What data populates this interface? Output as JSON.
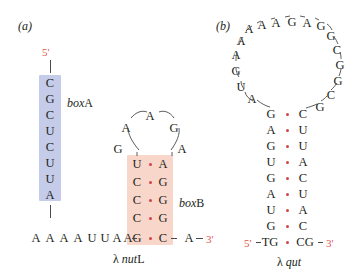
{
  "figure": {
    "panels": [
      {
        "id": "a",
        "label": "(a)",
        "name": "λ nutL",
        "name_lambda": "λ",
        "name_italic": "nut",
        "name_suffix": "L",
        "five_prime": "5'",
        "three_prime": "3'",
        "boxA_label_italic": "box",
        "boxA_label_roman": "A",
        "boxB_label_italic": "box",
        "boxB_label_roman": "B",
        "boxA_shade_color": "#c5ccea",
        "boxB_shade_color": "#f8d6c9",
        "boxA_sequence": [
          "C",
          "G",
          "C",
          "U",
          "C",
          "U",
          "U",
          "A"
        ],
        "tail_sequence": [
          "A",
          "A",
          "A",
          "A",
          "U",
          "U",
          "A",
          "A"
        ],
        "boxB_stem_left": [
          "U",
          "C",
          "C",
          "C",
          "G"
        ],
        "boxB_stem_right": [
          "A",
          "G",
          "G",
          "G",
          "C"
        ],
        "boxB_loop": [
          "G",
          "A",
          "A",
          "G",
          "A"
        ],
        "boxB_loop_positions": [
          "lower-left",
          "upper-left",
          "top",
          "upper-right",
          "lower-right"
        ],
        "closing_right": "A"
      },
      {
        "id": "b",
        "label": "(b)",
        "name": "λ qut",
        "name_lambda": "λ",
        "name_italic": "qut",
        "five_prime": "5'",
        "three_prime": "3'",
        "stem_left": [
          "G",
          "A",
          "G",
          "U",
          "G",
          "A",
          "U",
          "G"
        ],
        "stem_right": [
          "C",
          "U",
          "U",
          "A",
          "C",
          "U",
          "A",
          "C"
        ],
        "bottom_left": "TG",
        "bottom_right": "CG",
        "loop_left_down": [
          "A",
          "A",
          "G",
          "U",
          "A"
        ],
        "loop_top": [
          "A",
          "A",
          "A",
          "G",
          "A",
          "G"
        ],
        "loop_right_down": [
          "G",
          "C",
          "G",
          "G",
          "C",
          "G"
        ]
      }
    ],
    "colors": {
      "pair_dot": "#d1434a",
      "terminus_text": "#e0554e",
      "nucleotide_text": "#231f20",
      "connector": "#4a4a4a"
    }
  }
}
